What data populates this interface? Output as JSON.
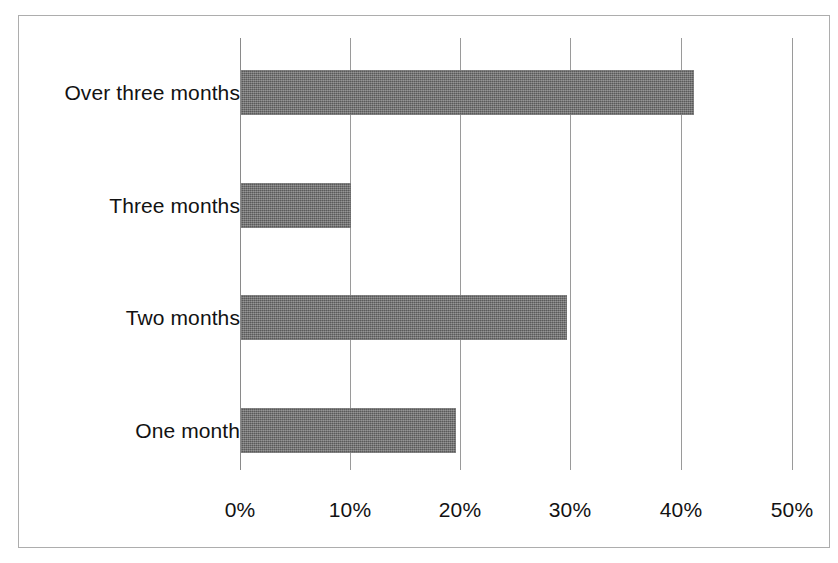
{
  "figure": {
    "background_color": "#ffffff",
    "frame_color": "#adadad",
    "bar_color": "#6e6e6e",
    "gridline_color": "#9a9a9a",
    "text_color": "#121212"
  },
  "chart_data": {
    "type": "bar",
    "orientation": "horizontal",
    "title": "",
    "subtitle": "",
    "xlabel": "",
    "ylabel": "",
    "categories": [
      "One month",
      "Two months",
      "Three months",
      "Over three months"
    ],
    "values": [
      19.5,
      29.5,
      10,
      41
    ],
    "value_unit": "%",
    "xlim": [
      0,
      50
    ],
    "xticks": [
      0,
      10,
      20,
      30,
      40,
      50
    ],
    "xtick_labels": [
      "0%",
      "10%",
      "20%",
      "30%",
      "40%",
      "50%"
    ],
    "grid": true,
    "grid_axis": "x",
    "legend": false,
    "legend_position": "none",
    "annotations": [],
    "bars": [
      {
        "category": "Over three months",
        "value": 41,
        "label": "41%"
      },
      {
        "category": "Three months",
        "value": 10,
        "label": "10%"
      },
      {
        "category": "Two months",
        "value": 29.5,
        "label": "29.5%"
      },
      {
        "category": "One month",
        "value": 19.5,
        "label": "19.5%"
      }
    ]
  }
}
